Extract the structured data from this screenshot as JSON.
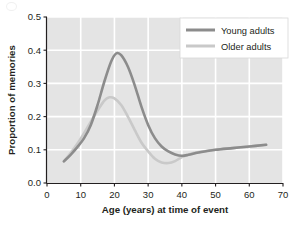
{
  "chart_data": {
    "type": "line",
    "title": "",
    "xlabel": "Age (years) at time of event",
    "ylabel": "Proportion of memories",
    "xlim": [
      0,
      70
    ],
    "ylim": [
      0.0,
      0.5
    ],
    "xticks": [
      "0",
      "10",
      "20",
      "30",
      "40",
      "50",
      "60",
      "70"
    ],
    "yticks": [
      "0.0",
      "0.1",
      "0.2",
      "0.3",
      "0.4",
      "0.5"
    ],
    "grid": true,
    "grid_color": "#ffffff",
    "plot_background": "#e4e4e4",
    "legend_position": "upper right",
    "series": [
      {
        "name": "Young adults",
        "color": "#8c8c8c",
        "x": [
          5,
          7,
          9,
          11,
          13,
          15,
          17,
          19,
          20.5,
          22,
          24,
          26,
          28,
          30,
          32,
          34,
          36,
          38,
          40,
          42,
          45,
          50,
          55,
          60,
          65
        ],
        "values": [
          0.065,
          0.085,
          0.108,
          0.135,
          0.175,
          0.235,
          0.305,
          0.365,
          0.39,
          0.385,
          0.35,
          0.295,
          0.23,
          0.175,
          0.135,
          0.11,
          0.095,
          0.086,
          0.082,
          0.085,
          0.092,
          0.1,
          0.105,
          0.11,
          0.115
        ]
      },
      {
        "name": "Older adults",
        "color": "#c9c9c9",
        "x": [
          5,
          7,
          9,
          11,
          13,
          15,
          17,
          18.5,
          20,
          22,
          24,
          26,
          28,
          30,
          32,
          34,
          36,
          38,
          40,
          42,
          45,
          50,
          55,
          60,
          65
        ],
        "values": [
          0.065,
          0.09,
          0.118,
          0.15,
          0.185,
          0.218,
          0.248,
          0.258,
          0.255,
          0.235,
          0.2,
          0.16,
          0.122,
          0.095,
          0.073,
          0.062,
          0.06,
          0.066,
          0.078,
          0.086,
          0.093,
          0.1,
          0.105,
          0.11,
          0.115
        ]
      }
    ],
    "annotations": {
      "young_peak": {
        "x": 20.5,
        "y": 0.39
      },
      "older_peak": {
        "x": 18.5,
        "y": 0.26
      },
      "older_trough": {
        "x": 35,
        "y": 0.06
      }
    }
  },
  "legend": {
    "items": [
      {
        "label": "Young adults",
        "swatch": "#8c8c8c"
      },
      {
        "label": "Older adults",
        "swatch": "#c9c9c9"
      }
    ]
  }
}
